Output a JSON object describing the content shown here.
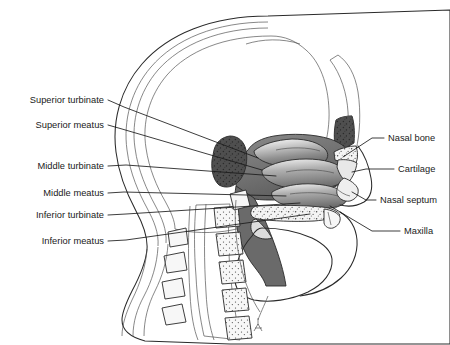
{
  "figure": {
    "view": "midsagittal head, facing right",
    "background_color": "#ffffff",
    "line_color": "#1a1a1a",
    "style": "grayscale medical line illustration with stipple and gradient shading"
  },
  "labels_left": [
    {
      "id": "superior-turbinate",
      "text": "Superior turbinate",
      "text_x": 104,
      "text_y": 103,
      "leader": "M108,100 L124,107 L258,158"
    },
    {
      "id": "superior-meatus",
      "text": "Superior meatus",
      "text_x": 104,
      "text_y": 128,
      "leader": "M108,125 L122,129 L262,170"
    },
    {
      "id": "middle-turbinate",
      "text": "Middle turbinate",
      "text_x": 104,
      "text_y": 169,
      "leader": "M108,166 L126,165 L276,176"
    },
    {
      "id": "middle-meatus",
      "text": "Middle meatus",
      "text_x": 104,
      "text_y": 196,
      "leader": "M108,193 L124,192 L286,196"
    },
    {
      "id": "inferior-turbinate",
      "text": "Inferior turbinate",
      "text_x": 104,
      "text_y": 218,
      "leader": "M108,215 L126,214 L300,203"
    },
    {
      "id": "inferior-meatus",
      "text": "Inferior meatus",
      "text_x": 104,
      "text_y": 244,
      "leader": "M108,241 L126,240 L310,214"
    }
  ],
  "labels_right": [
    {
      "id": "nasal-bone",
      "text": "Nasal bone",
      "text_x": 388,
      "text_y": 141,
      "leader": "M384,138 L372,138 L343,157"
    },
    {
      "id": "cartilage",
      "text": "Cartilage",
      "text_x": 398,
      "text_y": 172,
      "leader": "M394,169 L366,169 L352,172"
    },
    {
      "id": "nasal-septum",
      "text": "Nasal septum",
      "text_x": 380,
      "text_y": 203,
      "leader": "M376,200 L366,200 L352,192"
    },
    {
      "id": "maxilla",
      "text": "Maxilla",
      "text_x": 404,
      "text_y": 234,
      "leader": "M400,231 L372,231 L330,206"
    }
  ],
  "anatomy_regions": [
    {
      "id": "cranial-cavity",
      "name": "cranial cavity",
      "shade": "#f2f2f2"
    },
    {
      "id": "frontal-sinus",
      "name": "frontal sinus",
      "shade": "#4a4a4a"
    },
    {
      "id": "sphenoid-sinus",
      "name": "sphenoid sinus",
      "shade": "#555555"
    },
    {
      "id": "turbinates",
      "name": "nasal turbinates",
      "shade": "#8a8a8a"
    },
    {
      "id": "nasal-airway",
      "name": "nasal airway",
      "shade": "#6e6e6e"
    },
    {
      "id": "hard-palate",
      "name": "hard palate",
      "shade": "#ededed"
    },
    {
      "id": "tongue",
      "name": "tongue",
      "shade": "#fafafa"
    },
    {
      "id": "cervical-spine",
      "name": "cervical vertebrae",
      "shade": "#f0f0f0"
    }
  ],
  "signature": {
    "text": "",
    "x": 258,
    "y": 330,
    "note": "small artist signature mark"
  }
}
